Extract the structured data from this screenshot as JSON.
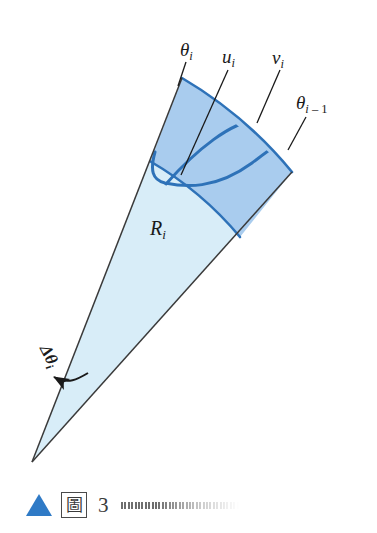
{
  "figure": {
    "colors": {
      "inner_sector_fill": "#d8edf8",
      "outer_band_fill": "#a9ccee",
      "curve_stroke": "#2e72b8",
      "ray_stroke": "#3a3a3a",
      "label_color": "#1a1a1a",
      "triangle_blue": "#2f7ac6"
    },
    "labels": {
      "theta_i": {
        "base": "θ",
        "sub": "i"
      },
      "u_i": {
        "base": "u",
        "sub": "i"
      },
      "v_i": {
        "base": "v",
        "sub": "i"
      },
      "theta_i_minus_1": {
        "base": "θ",
        "sub": "i",
        "sub_tail": " – 1"
      },
      "R_i": {
        "base": "R",
        "sub": "i"
      },
      "delta_theta_i": {
        "base": "Δθ",
        "sub": "i"
      }
    },
    "geometry": {
      "apex": [
        32,
        462
      ],
      "ray_theta_i_end": [
        182,
        78
      ],
      "ray_theta_im1_end": [
        292,
        172
      ],
      "inner_arc_radius": 335,
      "outer_arc_radius": 412
    }
  },
  "caption": {
    "triangle_icon": "triangle-up-icon",
    "boxed_glyph": "圖",
    "number": "3"
  }
}
